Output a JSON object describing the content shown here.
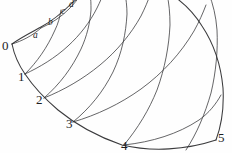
{
  "figure": {
    "name": "curvilinear-mesh-diagram",
    "background_color": "#fefefe",
    "line_color": "#3a3a3c",
    "label_color": "#1d1d1f",
    "width": 232,
    "height": 153
  },
  "labels": {
    "numeric": [
      {
        "text": "0",
        "x": 2,
        "y": 39
      },
      {
        "text": "1",
        "x": 18,
        "y": 70
      },
      {
        "text": "2",
        "x": 36,
        "y": 93
      },
      {
        "text": "3",
        "x": 66,
        "y": 117
      },
      {
        "text": "4",
        "x": 121,
        "y": 139
      },
      {
        "text": "5",
        "x": 218,
        "y": 131
      }
    ],
    "alpha": [
      {
        "text": "a",
        "x": 33,
        "y": 31
      },
      {
        "text": "b",
        "x": 48,
        "y": 18
      },
      {
        "text": "c",
        "x": 61,
        "y": 7
      },
      {
        "text": "d",
        "x": 69,
        "y": 0
      }
    ]
  },
  "geometry": {
    "boundaries": [
      {
        "name": "left-boundary-arc",
        "path": "M 12,44 C 14,54 18,64 25,74 C 33,86 44,98 58,110 C 75,124 96,136 122,145 C 152,152 186,150 216,140"
      },
      {
        "name": "upper-left-boundary",
        "path": "M 12,44 C 20,38 30,33 41,27 C 52,21 62,13 72,3 C 76,0 79,-3 82,-6"
      },
      {
        "name": "right-boundary",
        "path": "M 216,140 C 222,124 224,106 223,88 C 221,66 214,44 202,26 C 194,13 184,3 172,-5"
      }
    ],
    "radial_lines": [
      {
        "name": "radial-0a",
        "path": "M 12,44 C 22,41 32,36 41,28"
      },
      {
        "name": "radial-1b",
        "path": "M 25,74 C 37,62 47,48 55,30 C 58,24 60,17 61,10"
      },
      {
        "name": "radial-2c",
        "path": "M 44,98 C 60,84 72,68 81,49 C 87,36 90,23 91,10 C 91,4 91,-1 90,-5"
      },
      {
        "name": "radial-3d",
        "path": "M 73,122 C 90,108 103,92 113,72 C 122,53 126,33 127,14 C 127,6 126,-1 125,-7"
      },
      {
        "name": "radial-4",
        "path": "M 124,145 C 138,128 149,110 157,90 C 165,68 169,46 170,25 C 170,13 169,3 167,-6"
      },
      {
        "name": "radial-5",
        "path": "M 186,150 C 197,133 205,114 211,93 C 216,72 218,50 217,30 C 216,16 213,4 209,-6"
      }
    ],
    "circumferential_lines": [
      {
        "name": "arc-a-d",
        "path": "M 41,28 C 52,23 61,17 69,9 C 74,4 78,-1 81,-6"
      },
      {
        "name": "arc-1-outer",
        "path": "M 25,74 C 40,67 55,58 68,46 C 80,35 90,22 97,8 C 100,2 102,-3 104,-7"
      },
      {
        "name": "arc-2-outer",
        "path": "M 44,98 C 64,90 83,79 100,65 C 117,51 131,34 141,16 C 145,8 148,1 150,-5"
      },
      {
        "name": "arc-3-outer",
        "path": "M 73,122 C 97,115 120,104 141,89 C 163,73 181,53 194,31 C 199,22 203,13 206,5"
      },
      {
        "name": "arc-4-outer",
        "path": "M 124,145 C 152,142 178,134 199,120 C 209,113 216,104 221,95"
      }
    ]
  }
}
